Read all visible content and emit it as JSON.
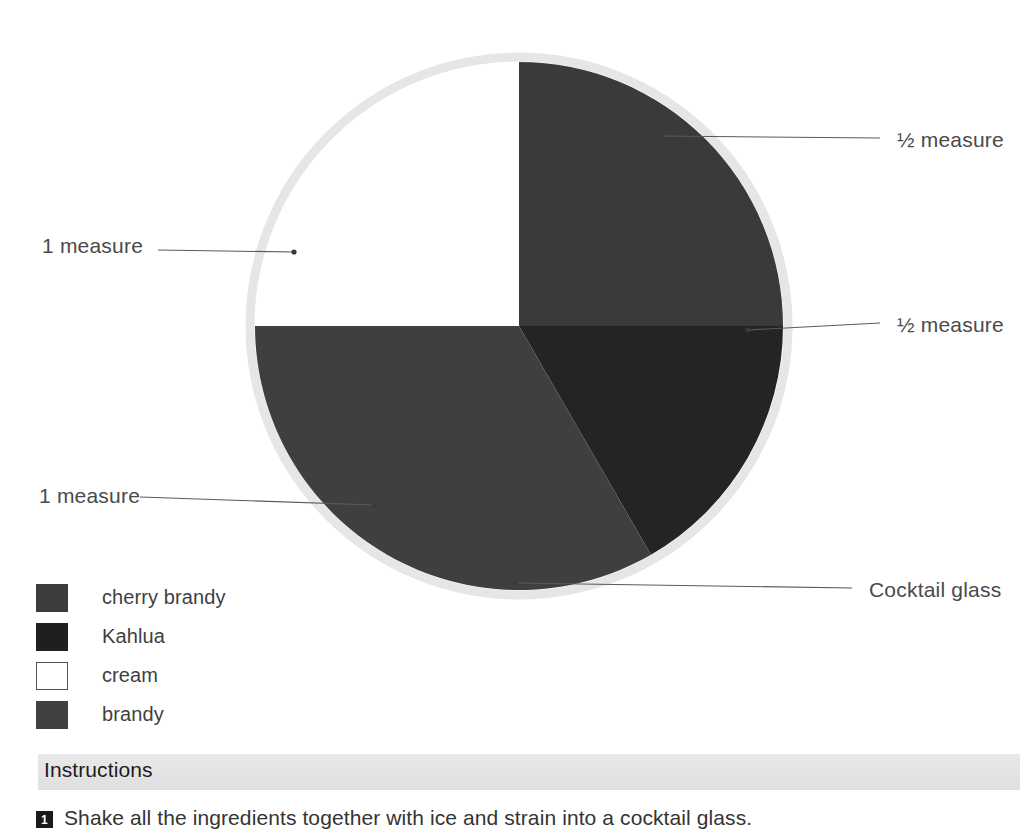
{
  "chart_data": {
    "type": "pie",
    "title": "",
    "center": {
      "x": 519,
      "y": 326
    },
    "radius": 264,
    "rim_color": "#e2e2e2",
    "legend_position": "bottom-left",
    "categories": [
      "cherry brandy",
      "Kahlua",
      "brandy",
      "cream"
    ],
    "values": [
      0.5,
      0.5,
      1,
      1
    ],
    "units": "measure",
    "slices": [
      {
        "label": "cherry brandy",
        "value": 0.5,
        "amount_text": "½ measure",
        "color": "#3a3a3a",
        "start_angle": 0,
        "end_angle": 90
      },
      {
        "label": "Kahlua",
        "value": 0.5,
        "amount_text": "½ measure",
        "color": "#242424",
        "start_angle": 90,
        "end_angle": 150
      },
      {
        "label": "brandy",
        "value": 1,
        "amount_text": "1 measure",
        "color": "#3f3f3f",
        "start_angle": 150,
        "end_angle": 270
      },
      {
        "label": "cream",
        "value": 1,
        "amount_text": "1 measure",
        "color": "#ffffff",
        "start_angle": 270,
        "end_angle": 360
      }
    ]
  },
  "callouts": [
    {
      "id": "half-top",
      "text": "½ measure",
      "anchor": {
        "x": 660,
        "y": 136
      },
      "elbow": {
        "x": 880,
        "y": 138
      }
    },
    {
      "id": "half-right",
      "text": "½ measure",
      "anchor": {
        "x": 748,
        "y": 330
      },
      "elbow": {
        "x": 880,
        "y": 323
      }
    },
    {
      "id": "cocktail",
      "text": "Cocktail glass",
      "anchor": {
        "x": 515,
        "y": 583
      },
      "elbow": {
        "x": 852,
        "y": 588
      }
    },
    {
      "id": "one-left",
      "text": "1 measure",
      "anchor": {
        "x": 294,
        "y": 252
      },
      "elbow": {
        "x": 158,
        "y": 250
      }
    },
    {
      "id": "one-lower",
      "text": "1 measure",
      "anchor": {
        "x": 374,
        "y": 505
      },
      "elbow": {
        "x": 140,
        "y": 497
      }
    }
  ],
  "legend": {
    "items": [
      {
        "label": "cherry brandy",
        "color": "#3c3c3c",
        "border": "#3c3c3c"
      },
      {
        "label": "Kahlua",
        "color": "#1f1f1f",
        "border": "#1f1f1f"
      },
      {
        "label": "cream",
        "color": "#ffffff",
        "border": "#555555"
      },
      {
        "label": "brandy",
        "color": "#414141",
        "border": "#414141"
      }
    ]
  },
  "instructions": {
    "title": "Instructions",
    "steps": [
      {
        "number": "1",
        "text": "Shake all the ingredients together with ice and strain into a cocktail glass."
      }
    ]
  }
}
